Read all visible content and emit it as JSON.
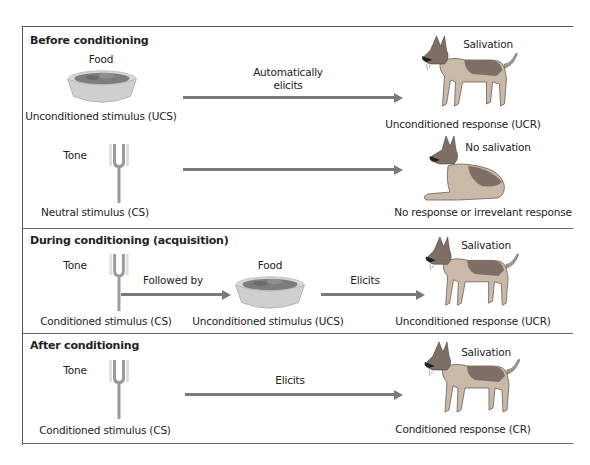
{
  "colors": {
    "border": "#555555",
    "arrow": "#7a7a7a",
    "bowl": "#d9d9d9",
    "food": "#7d7d7d",
    "dog_tan": "#c9b9a8",
    "dog_dark": "#7e6e66",
    "fork": "#9a9a9a"
  },
  "sections": [
    {
      "title": "Before conditioning",
      "rows": [
        {
          "stimulus_icon": "food-bowl-icon",
          "stimulus_caption": "Food",
          "stimulus_label": "Unconditioned stimulus (UCS)",
          "arrow_label_line1": "Automatically",
          "arrow_label_line2": "elicits",
          "response_icon": "standing-dog-icon",
          "response_caption": "Salivation",
          "response_label": "Unconditioned response (UCR)"
        },
        {
          "stimulus_icon": "tuning-fork-icon",
          "stimulus_caption": "Tone",
          "stimulus_label": "Neutral stimulus (CS)",
          "arrow_label": "",
          "response_icon": "lying-dog-icon",
          "response_caption": "No salivation",
          "response_label": "No response or irrevelant response"
        }
      ]
    },
    {
      "title": "During conditioning (acquisition)",
      "stimulus1_icon": "tuning-fork-icon",
      "stimulus1_caption": "Tone",
      "stimulus1_label": "Conditioned stimulus (CS)",
      "arrow1_label": "Followed by",
      "stimulus2_icon": "food-bowl-icon",
      "stimulus2_caption": "Food",
      "stimulus2_label": "Unconditioned stimulus (UCS)",
      "arrow2_label": "Elicits",
      "response_icon": "standing-dog-icon",
      "response_caption": "Salivation",
      "response_label": "Unconditioned response (UCR)"
    },
    {
      "title": "After conditioning",
      "stimulus_icon": "tuning-fork-icon",
      "stimulus_caption": "Tone",
      "stimulus_label": "Conditioned stimulus (CS)",
      "arrow_label": "Elicits",
      "response_icon": "standing-dog-icon",
      "response_caption": "Salivation",
      "response_label": "Conditioned response (CR)"
    }
  ]
}
